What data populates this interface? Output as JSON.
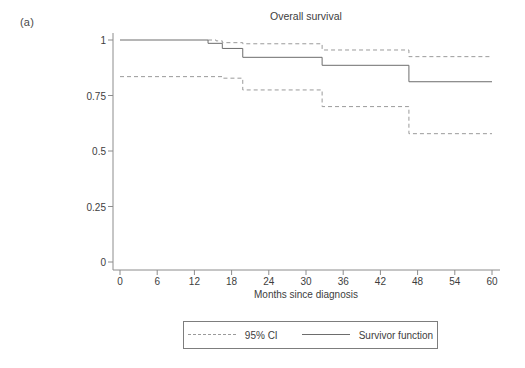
{
  "figure": {
    "panel_label": "(a)",
    "title": "Overall survival",
    "background_color": "#ffffff"
  },
  "legend": {
    "position": "below-axis",
    "entries": [
      {
        "label": "95% CI",
        "style": "dashed",
        "color": "#9a9a9a"
      },
      {
        "label": "Survivor function",
        "style": "solid",
        "color": "#6d6d6d"
      }
    ]
  },
  "axes": {
    "x": {
      "label": "Months since diagnosis",
      "ticks": [
        "0",
        "6",
        "12",
        "18",
        "24",
        "30",
        "36",
        "42",
        "48",
        "54",
        "60"
      ],
      "range": [
        0,
        60
      ]
    },
    "y": {
      "label": "",
      "ticks": [
        "0",
        "0.25",
        "0.5",
        "0.75",
        "1"
      ],
      "range": [
        0,
        1
      ]
    }
  },
  "chart_data": {
    "type": "line",
    "subtype": "kaplan-meier-step",
    "title": "Overall survival",
    "xlabel": "Months since diagnosis",
    "ylabel": "",
    "xlim": [
      0,
      60
    ],
    "ylim": [
      0,
      1
    ],
    "grid": false,
    "legend_position": "bottom",
    "series": [
      {
        "name": "Survivor function",
        "style": "solid",
        "color": "#6d6d6d",
        "x": [
          0,
          14.2,
          14.2,
          16.5,
          16.5,
          19.8,
          19.8,
          32.6,
          32.6,
          46.6,
          46.6,
          60
        ],
        "y": [
          1.0,
          1.0,
          0.985,
          0.985,
          0.962,
          0.962,
          0.922,
          0.922,
          0.886,
          0.886,
          0.812,
          0.812
        ]
      },
      {
        "name": "95% CI upper",
        "style": "dashed",
        "color": "#9a9a9a",
        "x": [
          14.2,
          15.5,
          15.5,
          16.5,
          16.5,
          19.8,
          19.8,
          32.6,
          32.6,
          46.6,
          46.6,
          60
        ],
        "y": [
          1.0,
          1.0,
          0.996,
          0.996,
          0.988,
          0.988,
          0.983,
          0.983,
          0.955,
          0.955,
          0.925,
          0.925
        ]
      },
      {
        "name": "95% CI lower",
        "style": "dashed",
        "color": "#9a9a9a",
        "x": [
          0,
          16.5,
          16.5,
          19.8,
          19.8,
          32.6,
          32.6,
          46.6,
          46.6,
          60
        ],
        "y": [
          0.835,
          0.835,
          0.828,
          0.828,
          0.775,
          0.775,
          0.7,
          0.7,
          0.578,
          0.578
        ]
      }
    ]
  }
}
